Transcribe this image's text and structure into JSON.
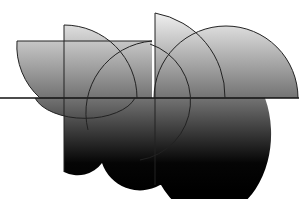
{
  "artwork": {
    "description": "Abstract composition of overlapping semicircles, quarter circles and rectangles with a vertical gray-to-black gradient, crossed by a horizontal line",
    "colors": {
      "background": "#ffffff",
      "gradient_top": "#f2f2f2",
      "gradient_mid": "#7a7a7a",
      "gradient_bottom": "#000000",
      "stroke": "#222222"
    }
  }
}
